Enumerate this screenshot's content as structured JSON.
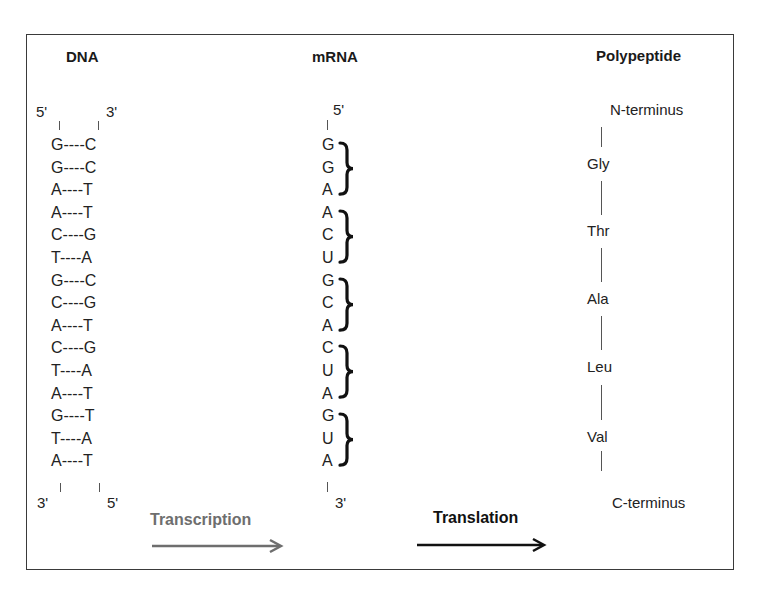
{
  "headers": {
    "dna": "DNA",
    "mrna": "mRNA",
    "polypeptide": "Polypeptide"
  },
  "dna": {
    "top_left_end": "5'",
    "top_right_end": "3'",
    "bottom_left_end": "3'",
    "bottom_right_end": "5'",
    "pairs": [
      {
        "left": "G",
        "bond": "----",
        "right": "C",
        "text": "G----C"
      },
      {
        "left": "G",
        "bond": "----",
        "right": "C",
        "text": "G----C"
      },
      {
        "left": "A",
        "bond": "----",
        "right": "T",
        "text": "A----T"
      },
      {
        "left": "A",
        "bond": "----",
        "right": "T",
        "text": "A----T"
      },
      {
        "left": "C",
        "bond": "----",
        "right": "G",
        "text": "C----G"
      },
      {
        "left": "T",
        "bond": "----",
        "right": "A",
        "text": "T----A"
      },
      {
        "left": "G",
        "bond": "----",
        "right": "C",
        "text": "G----C"
      },
      {
        "left": "C",
        "bond": "----",
        "right": "G",
        "text": "C----G"
      },
      {
        "left": "A",
        "bond": "----",
        "right": "T",
        "text": "A----T"
      },
      {
        "left": "C",
        "bond": "----",
        "right": "G",
        "text": "C----G"
      },
      {
        "left": "T",
        "bond": "----",
        "right": "A",
        "text": "T----A"
      },
      {
        "left": "A",
        "bond": "----",
        "right": "T",
        "text": "A----T"
      },
      {
        "left": "G",
        "bond": "----",
        "right": "T",
        "text": "G----T"
      },
      {
        "left": "T",
        "bond": "----",
        "right": "A",
        "text": "T----A"
      },
      {
        "left": "A",
        "bond": "----",
        "right": "T",
        "text": "A----T"
      }
    ]
  },
  "mrna": {
    "top_end": "5'",
    "bottom_end": "3'",
    "bases": [
      "G",
      "G",
      "A",
      "A",
      "C",
      "U",
      "G",
      "C",
      "A",
      "C",
      "U",
      "A",
      "G",
      "U",
      "A"
    ],
    "codons": [
      "GGA",
      "ACU",
      "GCA",
      "CUA",
      "GUA"
    ]
  },
  "polypeptide": {
    "n_terminus": "N-terminus",
    "c_terminus": "C-terminus",
    "residues": [
      "Gly",
      "Thr",
      "Ala",
      "Leu",
      "Val"
    ]
  },
  "processes": {
    "transcription": {
      "label": "Transcription",
      "color": "#6e6e6e"
    },
    "translation": {
      "label": "Translation",
      "color": "#111111"
    }
  },
  "colors": {
    "border": "#3a3a3a",
    "text": "#1a1a1a"
  }
}
